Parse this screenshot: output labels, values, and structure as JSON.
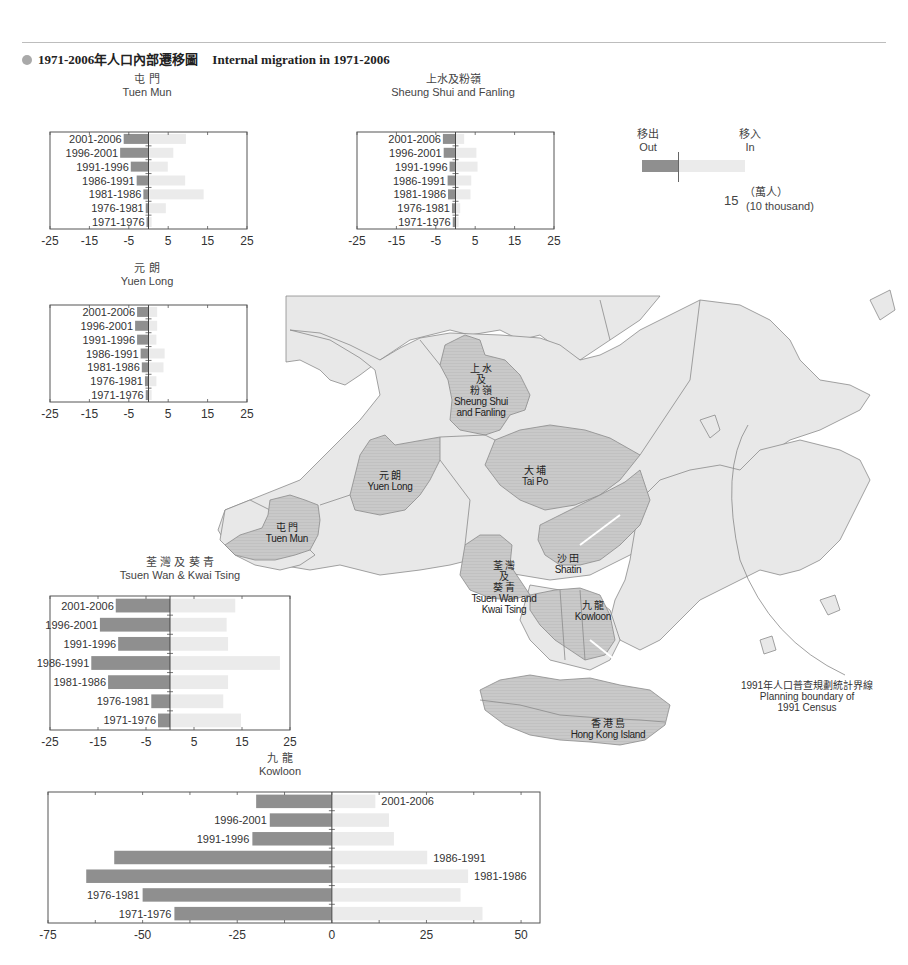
{
  "header": {
    "title_zh": "1971-2006年人口內部遷移圖",
    "title_en": "Internal migration in 1971-2006"
  },
  "colors": {
    "out_bar": "#8f8f8f",
    "in_bar": "#ebebeb",
    "land": "#e8e8e8",
    "highlight_district": "#c9c9c9",
    "boundary": "#8a8a8a",
    "axis": "#555555"
  },
  "legend": {
    "out_zh": "移出",
    "out_en": "Out",
    "in_zh": "移入",
    "in_en": "In",
    "scale_value": "15",
    "unit_zh": "（萬人）",
    "unit_en": "(10 thousand)"
  },
  "map_labels": {
    "sheung_shui": {
      "zh1": "上 水",
      "zh2": "及",
      "zh3": "粉 嶺",
      "en1": "Sheung Shui",
      "en2": "and Fanling"
    },
    "yuen_long": {
      "zh": "元 朗",
      "en": "Yuen Long"
    },
    "tai_po": {
      "zh": "大 埔",
      "en": "Tai Po"
    },
    "tuen_mun": {
      "zh": "屯 門",
      "en": "Tuen Mun"
    },
    "shatin": {
      "zh": "沙 田",
      "en": "Shatin"
    },
    "tsuen_wan": {
      "zh1": "荃 灣",
      "zh2": "及",
      "zh3": "葵 青",
      "en1": "Tsuen Wan and",
      "en2": "Kwai Tsing"
    },
    "kowloon": {
      "zh": "九 龍",
      "en": "Kowloon"
    },
    "hong_kong_island": {
      "zh": "香 港 島",
      "en": "Hong Kong Island"
    },
    "census_boundary": {
      "zh": "1991年人口普查規劃統計界線",
      "en1": "Planning boundary of",
      "en2": "1991 Census"
    }
  },
  "chart_data": [
    {
      "type": "bar",
      "id": "tuen_mun",
      "title": "屯 門 Tuen Mun",
      "title_zh": "屯 門",
      "title_en": "Tuen Mun",
      "categories": [
        "2001-2006",
        "1996-2001",
        "1991-1996",
        "1986-1991",
        "1981-1986",
        "1976-1981",
        "1971-1976"
      ],
      "series": [
        {
          "name": "Out",
          "values": [
            -6.3,
            -7.2,
            -4.5,
            -3.0,
            -1.3,
            -0.7,
            -0.5
          ]
        },
        {
          "name": "In",
          "values": [
            9.5,
            6.3,
            4.9,
            9.3,
            14.0,
            4.4,
            0.8
          ]
        }
      ],
      "xticks": [
        -25,
        -15,
        -5,
        5,
        15,
        25
      ],
      "xlim": [
        -25,
        25
      ],
      "xlabel": "",
      "ylabel": "",
      "orientation": "horizontal-diverging"
    },
    {
      "type": "bar",
      "id": "sheung_shui",
      "title": "上水及粉嶺 Sheung Shui and Fanling",
      "title_zh": "上水及粉嶺",
      "title_en": "Sheung Shui and Fanling",
      "categories": [
        "2001-2006",
        "1996-2001",
        "1991-1996",
        "1986-1991",
        "1981-1986",
        "1976-1981",
        "1971-1976"
      ],
      "series": [
        {
          "name": "Out",
          "values": [
            -3.2,
            -3.0,
            -1.5,
            -2.0,
            -1.9,
            -0.9,
            -0.7
          ]
        },
        {
          "name": "In",
          "values": [
            2.2,
            5.3,
            5.6,
            4.0,
            3.8,
            1.2,
            0.8
          ]
        }
      ],
      "xticks": [
        -25,
        -15,
        -5,
        5,
        15,
        25
      ],
      "xlim": [
        -25,
        25
      ],
      "xlabel": "",
      "ylabel": "",
      "orientation": "horizontal-diverging"
    },
    {
      "type": "bar",
      "id": "yuen_long",
      "title": "元 朗 Yuen Long",
      "title_zh": "元 朗",
      "title_en": "Yuen Long",
      "categories": [
        "2001-2006",
        "1996-2001",
        "1991-1996",
        "1986-1991",
        "1981-1986",
        "1976-1981",
        "1971-1976"
      ],
      "series": [
        {
          "name": "Out",
          "values": [
            -2.9,
            -3.4,
            -2.9,
            -2.0,
            -1.7,
            -0.9,
            -0.7
          ]
        },
        {
          "name": "In",
          "values": [
            2.2,
            2.2,
            2.0,
            4.1,
            3.8,
            2.0,
            0.8
          ]
        }
      ],
      "xticks": [
        -25,
        -15,
        -5,
        5,
        15,
        25
      ],
      "xlim": [
        -25,
        25
      ],
      "xlabel": "",
      "ylabel": "",
      "orientation": "horizontal-diverging"
    },
    {
      "type": "bar",
      "id": "tsuen_wan",
      "title": "荃灣及葵青 Tsuen Wan & Kwai Tsing",
      "title_zh": "荃 灣 及 葵 青",
      "title_en": "Tsuen Wan & Kwai Tsing",
      "categories": [
        "2001-2006",
        "1996-2001",
        "1991-1996",
        "1986-1991",
        "1981-1986",
        "1976-1981",
        "1971-1976"
      ],
      "series": [
        {
          "name": "Out",
          "values": [
            -11.3,
            -14.6,
            -10.8,
            -16.4,
            -12.9,
            -3.9,
            -2.5
          ]
        },
        {
          "name": "In",
          "values": [
            13.6,
            11.8,
            12.1,
            22.9,
            12.1,
            11.1,
            14.8
          ]
        }
      ],
      "xticks": [
        -25,
        -15,
        -5,
        5,
        15,
        25
      ],
      "xlim": [
        -25,
        25
      ],
      "xlabel": "",
      "ylabel": "",
      "orientation": "horizontal-diverging"
    },
    {
      "type": "bar",
      "id": "kowloon",
      "title": "九 龍 Kowloon",
      "title_zh": "九 龍",
      "title_en": "Kowloon",
      "categories": [
        "2001-2006",
        "1996-2001",
        "1991-1996",
        "1986-1991",
        "1981-1986",
        "1976-1981",
        "1971-1976"
      ],
      "series": [
        {
          "name": "Out",
          "values": [
            -20.0,
            -16.4,
            -21.0,
            -57.5,
            -64.9,
            -50.0,
            -41.6
          ]
        },
        {
          "name": "In",
          "values": [
            11.5,
            15.1,
            16.4,
            25.2,
            36.0,
            34.0,
            39.8
          ]
        }
      ],
      "xticks": [
        -75,
        -50,
        -25,
        0,
        25,
        50
      ],
      "xlim": [
        -75,
        55
      ],
      "xlabel": "",
      "ylabel": "",
      "orientation": "horizontal-diverging"
    }
  ],
  "chart_layout": [
    {
      "box": [
        50,
        132,
        197,
        97
      ],
      "title_xy": [
        147,
        73
      ],
      "label_mode": "inside-left",
      "label_x": 112,
      "tick_font": 11
    },
    {
      "box": [
        357,
        132,
        197,
        97
      ],
      "title_xy": [
        453,
        73
      ],
      "label_mode": "inside-left",
      "label_x": 417,
      "tick_font": 11
    },
    {
      "box": [
        50,
        305,
        197,
        97
      ],
      "title_xy": [
        147,
        262
      ],
      "label_mode": "inside-left",
      "label_x": 112,
      "tick_font": 11
    },
    {
      "box": [
        50,
        596,
        240,
        134
      ],
      "title_xy": [
        180,
        556
      ],
      "label_mode": "beside-out",
      "label_x": 0,
      "tick_font": 11
    },
    {
      "box": [
        48,
        792,
        492,
        131
      ],
      "title_xy": [
        280,
        752
      ],
      "label_mode": "kowloon",
      "label_x": 0,
      "tick_font": 11
    }
  ]
}
